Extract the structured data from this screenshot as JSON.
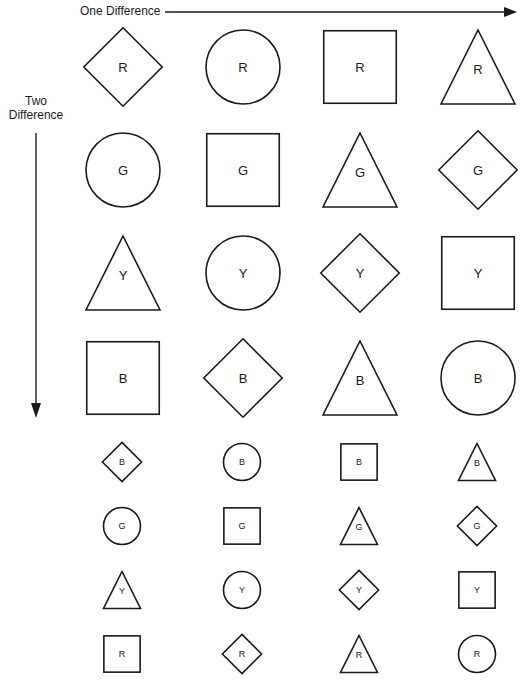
{
  "axes": {
    "horizontal_label": "One Difference",
    "vertical_label_line1": "Two",
    "vertical_label_line2": "Difference"
  },
  "large_grid": {
    "rows": [
      [
        {
          "shape": "diamond",
          "letter": "R"
        },
        {
          "shape": "circle",
          "letter": "R"
        },
        {
          "shape": "square",
          "letter": "R"
        },
        {
          "shape": "triangle",
          "letter": "R"
        }
      ],
      [
        {
          "shape": "circle",
          "letter": "G"
        },
        {
          "shape": "square",
          "letter": "G"
        },
        {
          "shape": "triangle",
          "letter": "G"
        },
        {
          "shape": "diamond",
          "letter": "G"
        }
      ],
      [
        {
          "shape": "triangle",
          "letter": "Y"
        },
        {
          "shape": "circle",
          "letter": "Y"
        },
        {
          "shape": "diamond",
          "letter": "Y"
        },
        {
          "shape": "square",
          "letter": "Y"
        }
      ],
      [
        {
          "shape": "square",
          "letter": "B"
        },
        {
          "shape": "diamond",
          "letter": "B"
        },
        {
          "shape": "triangle",
          "letter": "B"
        },
        {
          "shape": "circle",
          "letter": "B"
        }
      ]
    ]
  },
  "small_grid": {
    "rows": [
      [
        {
          "shape": "diamond",
          "letter": "B"
        },
        {
          "shape": "circle",
          "letter": "B"
        },
        {
          "shape": "square",
          "letter": "B"
        },
        {
          "shape": "triangle",
          "letter": "B"
        }
      ],
      [
        {
          "shape": "circle",
          "letter": "G"
        },
        {
          "shape": "square",
          "letter": "G"
        },
        {
          "shape": "triangle",
          "letter": "G"
        },
        {
          "shape": "diamond",
          "letter": "G"
        }
      ],
      [
        {
          "shape": "triangle",
          "letter": "Y"
        },
        {
          "shape": "circle",
          "letter": "Y"
        },
        {
          "shape": "diamond",
          "letter": "Y"
        },
        {
          "shape": "square",
          "letter": "Y"
        }
      ],
      [
        {
          "shape": "square",
          "letter": "R"
        },
        {
          "shape": "diamond",
          "letter": "R"
        },
        {
          "shape": "triangle",
          "letter": "R"
        },
        {
          "shape": "circle",
          "letter": "R"
        }
      ]
    ]
  },
  "colors": {
    "ink": "#1a1a1a",
    "background": "#ffffff"
  }
}
